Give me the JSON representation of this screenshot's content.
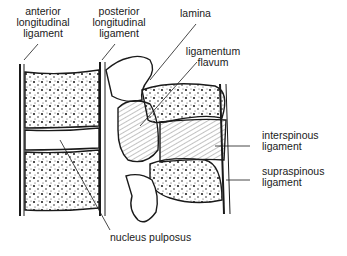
{
  "diagram": {
    "labels": {
      "anterior_longitudinal": [
        "anterior",
        "longitudinal",
        "ligament"
      ],
      "posterior_longitudinal": [
        "posterior",
        "longitudinal",
        "ligament"
      ],
      "lamina": [
        "lamina"
      ],
      "ligamentum_flavum": [
        "ligamentum",
        "flavum"
      ],
      "interspinous": [
        "interspinous",
        "ligament"
      ],
      "supraspinous": [
        "supraspinous",
        "ligament"
      ],
      "nucleus_pulposus": [
        "nucleus pulposus"
      ]
    },
    "colors": {
      "ink": "#1a1a1a",
      "background": "#ffffff"
    }
  }
}
